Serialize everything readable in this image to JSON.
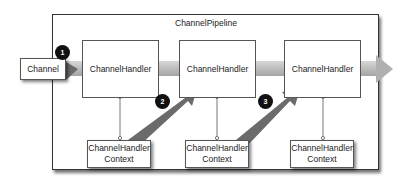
{
  "diagram": {
    "title": "ChannelPipeline",
    "channel": {
      "label": "Channel"
    },
    "handlers": [
      {
        "label": "ChannelHandler"
      },
      {
        "label": "ChannelHandler"
      },
      {
        "label": "ChannelHandler"
      }
    ],
    "contexts": [
      {
        "line1": "ChannelHandler",
        "line2": "Context"
      },
      {
        "line1": "ChannelHandler",
        "line2": "Context"
      },
      {
        "line1": "ChannelHandler",
        "line2": "Context"
      }
    ],
    "steps": [
      {
        "number": "1"
      },
      {
        "number": "2"
      },
      {
        "number": "3"
      }
    ],
    "colors": {
      "arrow_light": "#b8b8b8",
      "arrow_dark": "#6a6a6a",
      "badge": "#111111",
      "border": "#333333"
    }
  }
}
